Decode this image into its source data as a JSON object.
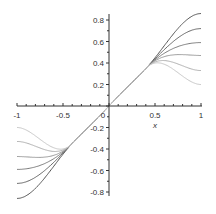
{
  "chart_data": {
    "type": "line",
    "title": "",
    "xlabel": "x",
    "ylabel": "",
    "xlim": [
      -1,
      1
    ],
    "ylim": [
      -0.85,
      0.85
    ],
    "grid": false,
    "x_ticks": [
      "-1",
      "-0.5",
      "0",
      "0.5",
      "1"
    ],
    "y_ticks": [
      "-0.8",
      "-0.6",
      "-0.4",
      "-0.2",
      "0.2",
      "0.4",
      "0.6",
      "0.8"
    ],
    "series": [
      {
        "name": "curve 1",
        "x": [
          -1,
          -0.4,
          0,
          0.4,
          1
        ],
        "y": [
          -0.86,
          -0.35,
          0,
          0.35,
          0.86
        ],
        "color": "#555555"
      },
      {
        "name": "curve 2",
        "x": [
          -1,
          -0.4,
          0,
          0.4,
          1
        ],
        "y": [
          -0.72,
          -0.35,
          0,
          0.35,
          0.72
        ],
        "color": "#666666"
      },
      {
        "name": "curve 3",
        "x": [
          -1,
          -0.4,
          0,
          0.4,
          1
        ],
        "y": [
          -0.59,
          -0.35,
          0,
          0.35,
          0.59
        ],
        "color": "#7a7a7a"
      },
      {
        "name": "curve 4",
        "x": [
          -1,
          -0.4,
          0,
          0.4,
          1
        ],
        "y": [
          -0.47,
          -0.35,
          0,
          0.35,
          0.47
        ],
        "color": "#999999"
      },
      {
        "name": "curve 5",
        "x": [
          -1,
          -0.4,
          0,
          0.4,
          1
        ],
        "y": [
          -0.33,
          -0.35,
          0,
          0.35,
          0.33
        ],
        "color": "#b0b0b0"
      },
      {
        "name": "curve 6",
        "x": [
          -1,
          -0.4,
          0,
          0.4,
          1
        ],
        "y": [
          -0.2,
          -0.35,
          0,
          0.35,
          0.2
        ],
        "color": "#c8c8c8"
      }
    ]
  },
  "labels": {
    "xlabel": "x",
    "xt_m1": "-1",
    "xt_m05": "-0.5",
    "xt_0": "0",
    "xt_05": "0.5",
    "xt_1": "1",
    "yt_08": "0.8",
    "yt_06": "0.6",
    "yt_04": "0.4",
    "yt_02": "0.2",
    "yt_m02": "-0.2",
    "yt_m04": "-0.4",
    "yt_m06": "-0.6",
    "yt_m08": "-0.8"
  }
}
